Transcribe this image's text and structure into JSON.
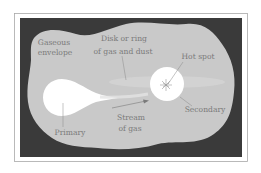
{
  "figure": {
    "labels": {
      "gaseous_envelope": [
        "Gaseous",
        "envelope"
      ],
      "disk": [
        "Disk or ring",
        "of gas and dust"
      ],
      "hot_spot": "Hot spot",
      "secondary": "Secondary",
      "stream": [
        "Stream",
        "of gas"
      ],
      "primary": "Primary"
    },
    "colors": {
      "background": "#3a3a3a",
      "envelope": "#c9c9c9",
      "stars": "#ffffff",
      "text": "#7a7a7a",
      "frame": "#a8a8a8"
    }
  }
}
